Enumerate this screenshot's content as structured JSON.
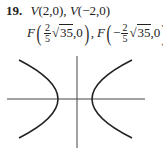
{
  "problem": {
    "number": "19.",
    "vertices_label": "V(2,0), V(−2,0)",
    "v1": "V",
    "v1_coords": "(2,0),",
    "v2": "V",
    "v2_coords": "(−2,0)",
    "foci": {
      "f1_label": "F",
      "f1_sign": "",
      "f2_label": "F",
      "f2_sign": "−",
      "frac_num": "2",
      "frac_den": "5",
      "radical_symbol": "√",
      "radicand": "35",
      "y_coord": ",0",
      "separator": ","
    }
  },
  "graph": {
    "type": "hyperbola",
    "orientation": "horizontal",
    "a": 2,
    "c_expression": "(2/5)√35",
    "stroke_color": "#222222"
  }
}
